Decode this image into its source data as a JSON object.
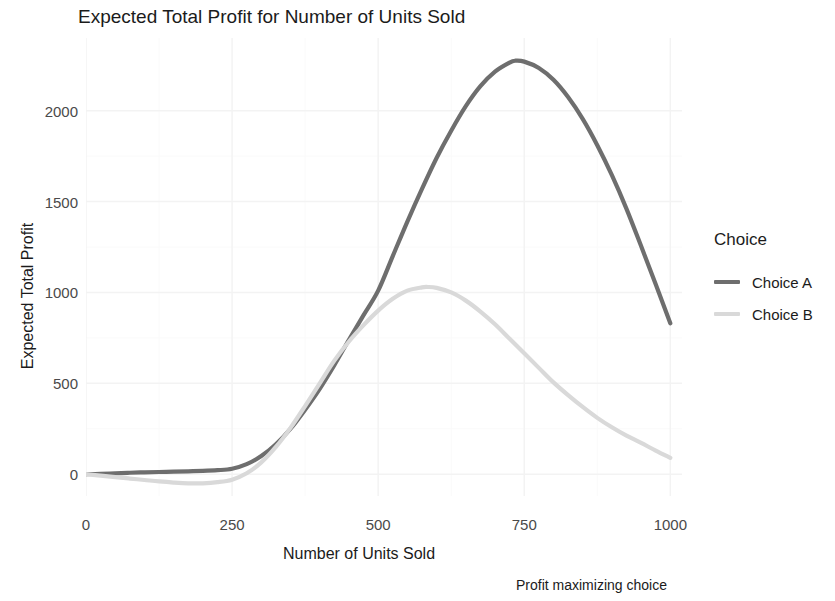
{
  "chart_data": {
    "type": "line",
    "title": "Expected Total Profit for Number of Units Sold",
    "xlabel": "Number of Units Sold",
    "ylabel": "Expected Total Profit",
    "caption": "Profit maximizing choice",
    "xlim": [
      0,
      1020
    ],
    "ylim": [
      -120,
      2400
    ],
    "xticks": [
      0,
      250,
      500,
      750,
      1000
    ],
    "xtick_labels": [
      "0",
      "250",
      "500",
      "750",
      "1000"
    ],
    "yticks": [
      0,
      500,
      1000,
      1500,
      2000
    ],
    "ytick_labels": [
      "0",
      "500",
      "1000",
      "1500",
      "2000"
    ],
    "grid": true,
    "legend": {
      "title": "Choice",
      "position": "right",
      "entries": [
        "Choice A",
        "Choice B"
      ]
    },
    "colors": {
      "choice_a": "#6e6e6e",
      "choice_b": "#d9d9d9",
      "grid": "#f2f2f2",
      "text": "#1b1b1b",
      "tick_text": "#4a4a4a",
      "background": "#ffffff"
    },
    "series": [
      {
        "name": "Choice A",
        "color": "#6e6e6e",
        "x": [
          0,
          25,
          50,
          75,
          100,
          125,
          150,
          175,
          200,
          225,
          250,
          275,
          300,
          325,
          350,
          375,
          400,
          425,
          450,
          475,
          500,
          525,
          550,
          575,
          600,
          625,
          650,
          675,
          700,
          725,
          735,
          750,
          775,
          800,
          825,
          850,
          875,
          900,
          925,
          950,
          975,
          1000
        ],
        "y": [
          0,
          2,
          5,
          8,
          10,
          12,
          14,
          16,
          18,
          22,
          30,
          55,
          100,
          165,
          250,
          355,
          470,
          600,
          740,
          875,
          1010,
          1200,
          1390,
          1570,
          1740,
          1890,
          2025,
          2135,
          2215,
          2265,
          2275,
          2270,
          2235,
          2170,
          2075,
          1955,
          1810,
          1645,
          1460,
          1255,
          1045,
          830
        ]
      },
      {
        "name": "Choice B",
        "color": "#d9d9d9",
        "x": [
          0,
          25,
          50,
          75,
          100,
          125,
          150,
          175,
          200,
          225,
          250,
          275,
          300,
          325,
          350,
          375,
          400,
          425,
          450,
          475,
          500,
          525,
          550,
          575,
          585,
          600,
          625,
          650,
          675,
          700,
          725,
          750,
          775,
          800,
          825,
          850,
          875,
          900,
          925,
          950,
          975,
          1000
        ],
        "y": [
          0,
          -8,
          -16,
          -24,
          -32,
          -40,
          -46,
          -50,
          -50,
          -44,
          -30,
          5,
          65,
          150,
          255,
          375,
          500,
          625,
          730,
          820,
          900,
          965,
          1010,
          1028,
          1030,
          1025,
          1000,
          955,
          895,
          825,
          745,
          665,
          585,
          505,
          435,
          370,
          310,
          258,
          212,
          172,
          130,
          90
        ]
      }
    ]
  }
}
